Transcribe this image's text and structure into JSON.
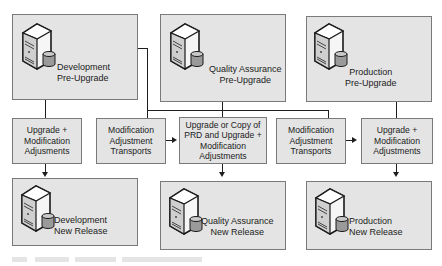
{
  "diagram": {
    "environments_pre": [
      {
        "id": "dev-pre",
        "line1": "Development",
        "line2": "Pre-Upgrade",
        "icon": "server-database-icon"
      },
      {
        "id": "qa-pre",
        "line1": "Quality Assurance",
        "line2": "Pre-Upgrade",
        "icon": "server-database-icon"
      },
      {
        "id": "prd-pre",
        "line1": "Production",
        "line2": "Pre-Upgrade",
        "icon": "server-database-icon"
      }
    ],
    "steps": [
      {
        "id": "dev-upgrade",
        "text": "Upgrade +\nModification\nAdjusments"
      },
      {
        "id": "transport-1",
        "text": "Modification\nAdjustment\nTransports"
      },
      {
        "id": "qa-upgrade",
        "text": "Upgrade or Copy of\nPRD and Upgrade +\nModification\nAdjustments"
      },
      {
        "id": "transport-2",
        "text": "Modification\nAdjustment\nTransports"
      },
      {
        "id": "prd-upgrade",
        "text": "Upgrade +\nModification\nAdjustments"
      }
    ],
    "environments_new": [
      {
        "id": "dev-new",
        "line1": "Development",
        "line2": "New Release",
        "icon": "server-database-icon"
      },
      {
        "id": "qa-new",
        "line1": "Quality Assurance",
        "line2": "New Release",
        "icon": "server-database-icon"
      },
      {
        "id": "prd-new",
        "line1": "Production",
        "line2": "New Release",
        "icon": "server-database-icon"
      }
    ],
    "colors": {
      "box_fill": "#e4e4e4",
      "box_border": "#7a7a7a",
      "line": "#1e1e1e"
    }
  }
}
